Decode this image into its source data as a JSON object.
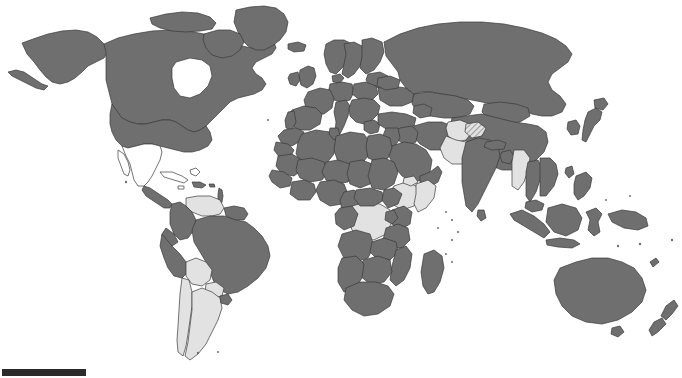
{
  "figure": {
    "type": "choropleth-world-map",
    "width": 682,
    "height": 378,
    "background_color": "#ffffff",
    "projection_hint": "equirectangular-like world map, full land extent, no graticule, no axis labels"
  },
  "legend": {
    "visible": false,
    "classes": [
      {
        "name": "included",
        "color": "#6f6f6f",
        "label": ""
      },
      {
        "name": "partial",
        "color": "#e2e2e2",
        "label": ""
      },
      {
        "name": "not-included",
        "color": "#ffffff",
        "label": ""
      }
    ]
  },
  "scale_bar": {
    "visible": true,
    "label": "",
    "color": "#2b2b2b",
    "x": 2,
    "y": 369,
    "width": 84,
    "height": 7
  },
  "style": {
    "border_color": "#3a3a3a",
    "border_width": 0.7,
    "dark_fill": "#6f6f6f",
    "light_fill": "#e2e2e2",
    "empty_fill": "#ffffff"
  },
  "chart_data": {
    "type": "heatmap",
    "title": "",
    "xlabel": "",
    "ylabel": "",
    "categories": [
      "Canada",
      "United States",
      "Alaska",
      "Greenland",
      "Mexico",
      "Central America",
      "Cuba",
      "Caribbean",
      "Colombia",
      "Venezuela",
      "Guyana",
      "Brazil",
      "Peru",
      "Ecuador",
      "Bolivia",
      "Paraguay",
      "Chile",
      "Argentina",
      "Uruguay",
      "United Kingdom",
      "Ireland",
      "Norway",
      "Sweden",
      "Finland",
      "France",
      "Spain",
      "Portugal",
      "Germany",
      "Poland",
      "Italy",
      "Greece",
      "Turkey",
      "Ukraine",
      "Russia",
      "Kazakhstan",
      "Iran",
      "Iraq",
      "Saudi Arabia",
      "Afghanistan",
      "Pakistan",
      "India",
      "Nepal",
      "Bangladesh",
      "Myanmar",
      "Thailand",
      "Vietnam",
      "China",
      "Mongolia",
      "Japan",
      "South Korea",
      "Indonesia",
      "Malaysia",
      "Philippines",
      "Papua New Guinea",
      "Morocco",
      "Algeria",
      "Libya",
      "Egypt",
      "Sudan",
      "Chad",
      "Niger",
      "Mali",
      "Nigeria",
      "Ethiopia",
      "Somalia",
      "DR Congo",
      "Kenya",
      "Tanzania",
      "Angola",
      "Zambia",
      "South Africa",
      "Madagascar",
      "Australia",
      "New Zealand"
    ],
    "values": [
      1,
      1,
      1,
      1,
      0,
      1,
      0,
      0,
      1,
      0.5,
      1,
      1,
      1,
      1,
      0.5,
      0.5,
      0.5,
      0.5,
      1,
      1,
      1,
      1,
      1,
      1,
      1,
      1,
      1,
      1,
      1,
      1,
      1,
      1,
      1,
      1,
      1,
      1,
      1,
      1,
      0.5,
      0.5,
      1,
      1,
      1,
      0.5,
      1,
      1,
      1,
      1,
      1,
      1,
      1,
      1,
      1,
      1,
      1,
      1,
      1,
      1,
      1,
      1,
      1,
      1,
      1,
      0.5,
      0.5,
      0.5,
      1,
      1,
      1,
      1,
      1,
      1,
      1,
      1
    ],
    "value_scale": {
      "1": "dark gray - included",
      "0.5": "light gray - partial",
      "0": "white - not included"
    },
    "grid": false,
    "legend_position": "none"
  }
}
